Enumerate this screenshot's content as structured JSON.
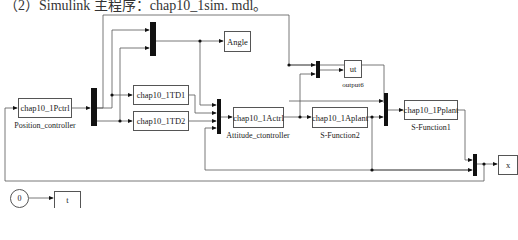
{
  "title": "（2）Simulink 主程序：chap10_1sim. mdl。",
  "blocks": {
    "pctrl": {
      "text": "chap10_1Pctrl",
      "label": "Position_controller"
    },
    "td1": {
      "text": "chap10_1TD1"
    },
    "td2": {
      "text": "chap10_1TD2"
    },
    "angle": {
      "text": "Angle"
    },
    "actrl": {
      "text": "chap10_1Actrl",
      "label": "Attitude_ctontroller"
    },
    "aplant": {
      "text": "chap10_1Aplant",
      "label": "S-Function2"
    },
    "ut": {
      "text": "ut",
      "label": "output6"
    },
    "pplant": {
      "text": "chap10_1Pplant",
      "label": "S-Function1"
    },
    "x": {
      "text": "x"
    },
    "const": {
      "text": "0"
    },
    "t": {
      "text": "t"
    }
  },
  "colors": {
    "line": "#555555",
    "mux": "#111111",
    "background": "#ffffff"
  }
}
